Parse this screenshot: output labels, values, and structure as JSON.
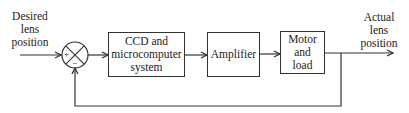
{
  "diagram": {
    "type": "feedback control block diagram",
    "input_label": "Desired lens position",
    "input_label_lines": [
      "Desired",
      "lens",
      "position"
    ],
    "output_label": "Actual lens position",
    "output_label_lines": [
      "Actual",
      "lens",
      "position"
    ],
    "summing_junction": {
      "plus_sign": "+",
      "minus_sign": "−"
    },
    "blocks": [
      {
        "id": "ccd",
        "lines": [
          "CCD and",
          "microcomputer",
          "system"
        ]
      },
      {
        "id": "amplifier",
        "lines": [
          "Amplifier"
        ]
      },
      {
        "id": "motor",
        "lines": [
          "Motor",
          "and",
          "load"
        ]
      }
    ],
    "feedback": "unity negative feedback from output to summing junction",
    "colors": {
      "line": "#333333",
      "text": "#222222",
      "background": "#ffffff"
    }
  }
}
